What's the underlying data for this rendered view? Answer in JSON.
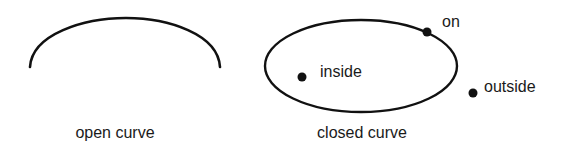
{
  "open_curve": {
    "caption": "open curve",
    "stroke": "#111111"
  },
  "closed_curve": {
    "caption": "closed curve",
    "stroke": "#111111"
  },
  "points": [
    {
      "id": "on",
      "label": "on"
    },
    {
      "id": "inside",
      "label": "inside"
    },
    {
      "id": "outside",
      "label": "outside"
    }
  ]
}
